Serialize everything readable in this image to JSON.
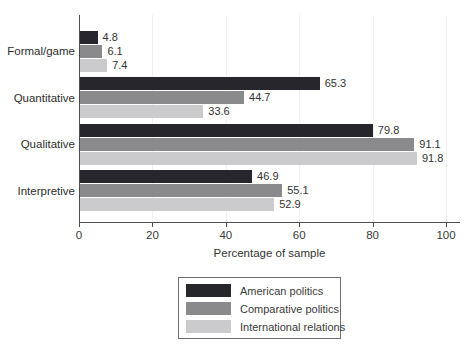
{
  "chart_data": {
    "type": "bar",
    "orientation": "horizontal",
    "title": "",
    "xlabel": "Percentage of sample",
    "ylabel": "",
    "xlim": [
      0,
      100
    ],
    "xticks": [
      0,
      20,
      40,
      60,
      80,
      100
    ],
    "grid": true,
    "value_labels": true,
    "legend_position": "bottom-center",
    "categories": [
      "Formal/game",
      "Quantitative",
      "Qualitative",
      "Interpretive"
    ],
    "series": [
      {
        "name": "American politics",
        "color": "#26262c",
        "values": [
          4.8,
          65.3,
          79.8,
          46.9
        ]
      },
      {
        "name": "Comparative politics",
        "color": "#8a8a8d",
        "values": [
          6.1,
          44.7,
          91.1,
          55.1
        ]
      },
      {
        "name": "International relations",
        "color": "#cbcbce",
        "values": [
          7.4,
          33.6,
          91.8,
          52.9
        ]
      }
    ]
  },
  "style": {
    "axis_color": "#4d4d4d",
    "gridline_color": "#f0f0f0",
    "text_color": "#333333",
    "legend_border_color": "#6e6e6e",
    "background": "#ffffff"
  }
}
